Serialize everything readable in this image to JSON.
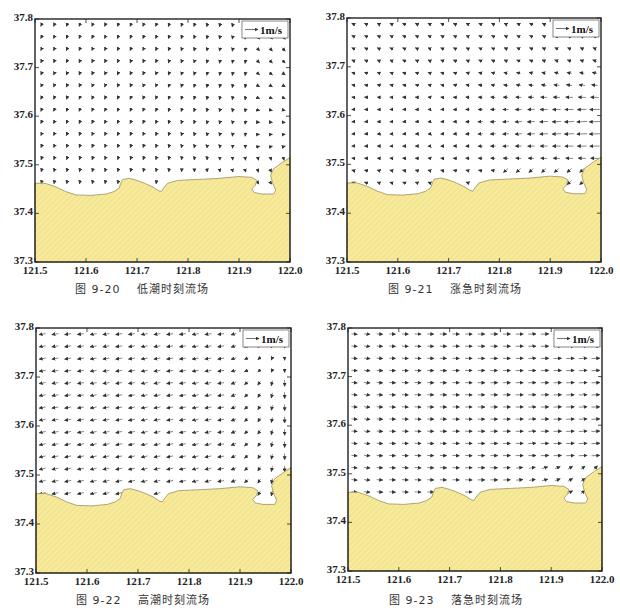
{
  "colors": {
    "land_fill": "#f4e68f",
    "land_hatch": "#fbf3c4",
    "coast_line": "#9a8f60",
    "frame": "#222222",
    "arrow": "#333333"
  },
  "chart_data": [
    {
      "type": "vector-field",
      "title": "图 9-20　低潮时刻流场",
      "caption_number": "图 9-20",
      "caption_text": "低潮时刻流场",
      "xlabel": "",
      "ylabel": "",
      "xlim": [
        121.5,
        122.0
      ],
      "ylim": [
        37.3,
        37.8
      ],
      "xticks": [
        "121.5",
        "121.6",
        "121.7",
        "121.8",
        "121.9",
        "122.0"
      ],
      "yticks": [
        "37.3",
        "37.4",
        "37.5",
        "37.6",
        "37.7",
        "37.8"
      ],
      "legend": "1m/s",
      "legend_position": "top-right",
      "flow_description": "Weak southwestward/southward flow in north; eastward flow along coast in the southeast, diverging near east boundary",
      "pattern": "low"
    },
    {
      "type": "vector-field",
      "title": "图 9-21　涨急时刻流场",
      "caption_number": "图 9-21",
      "caption_text": "涨急时刻流场",
      "xlabel": "",
      "ylabel": "",
      "xlim": [
        121.5,
        122.0
      ],
      "ylim": [
        37.3,
        37.8
      ],
      "xticks": [
        "121.5",
        "121.6",
        "121.7",
        "121.8",
        "121.9",
        "122.0"
      ],
      "yticks": [
        "37.3",
        "37.4",
        "37.5",
        "37.6",
        "37.7",
        "37.8"
      ],
      "legend": "1m/s",
      "legend_position": "top-right",
      "flow_description": "Westward / northwestward flood flow, strongest in the east near 37.55–37.65",
      "pattern": "flood"
    },
    {
      "type": "vector-field",
      "title": "图 9-22　高潮时刻流场",
      "caption_number": "图 9-22",
      "caption_text": "高潮时刻流场",
      "xlabel": "",
      "ylabel": "",
      "xlim": [
        121.5,
        122.0
      ],
      "ylim": [
        37.3,
        37.8
      ],
      "xticks": [
        "121.5",
        "121.6",
        "121.7",
        "121.8",
        "121.9",
        "122.0"
      ],
      "yticks": [
        "37.3",
        "37.4",
        "37.5",
        "37.6",
        "37.7",
        "37.8"
      ],
      "legend": "1m/s",
      "legend_position": "top-right",
      "flow_description": "Westward flow across most of domain; southward flow near eastern boundary toward the bay",
      "pattern": "high"
    },
    {
      "type": "vector-field",
      "title": "图 9-23　落急时刻流场",
      "caption_number": "图 9-23",
      "caption_text": "落急时刻流场",
      "xlabel": "",
      "ylabel": "",
      "xlim": [
        121.5,
        122.0
      ],
      "ylim": [
        37.3,
        37.8
      ],
      "xticks": [
        "121.5",
        "121.6",
        "121.7",
        "121.8",
        "121.9",
        "122.0"
      ],
      "yticks": [
        "37.3",
        "37.4",
        "37.5",
        "37.6",
        "37.7",
        "37.8"
      ],
      "legend": "1m/s",
      "legend_position": "top-right",
      "flow_description": "Eastward ebb flow, strongest in the east; northeastward flow out of the bay near 121.95",
      "pattern": "ebb"
    }
  ],
  "panels_layout": [
    {
      "left": 35,
      "top": 19,
      "width": 255,
      "height": 243,
      "caption_x": 75,
      "caption_y": 280
    },
    {
      "left": 347,
      "top": 18,
      "width": 254,
      "height": 244,
      "caption_x": 388,
      "caption_y": 280
    },
    {
      "left": 36,
      "top": 328,
      "width": 255,
      "height": 245,
      "caption_x": 76,
      "caption_y": 591
    },
    {
      "left": 348,
      "top": 328,
      "width": 254,
      "height": 243,
      "caption_x": 389,
      "caption_y": 591
    }
  ]
}
